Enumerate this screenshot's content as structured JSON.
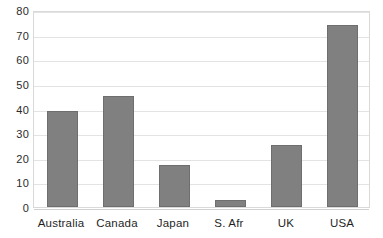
{
  "chart_data": {
    "type": "bar",
    "title": "",
    "subtitle": "",
    "xlabel": "",
    "ylabel": "",
    "categories": [
      "Australia",
      "Canada",
      "Japan",
      "S. Afr",
      "UK",
      "USA"
    ],
    "values": [
      39,
      45,
      17,
      3,
      25,
      74
    ],
    "ylim": [
      0,
      80
    ],
    "ytick_step": 10,
    "yticks": [
      0,
      10,
      20,
      30,
      40,
      50,
      60,
      70,
      80
    ],
    "ytick_labels": [
      "0",
      "10",
      "20",
      "30",
      "40",
      "50",
      "60",
      "70",
      "80"
    ],
    "grid": "horizontal",
    "legend": "none",
    "series": [
      {
        "name": "",
        "values": [
          39,
          45,
          17,
          3,
          25,
          74
        ]
      }
    ],
    "colors": {
      "bar_fill": "#808080",
      "bar_border": "#6e6e6e",
      "gridline": "#e3e3e3",
      "plot_border": "#d9d9d9",
      "background": "#ffffff",
      "text": "#1f1f1f"
    }
  }
}
